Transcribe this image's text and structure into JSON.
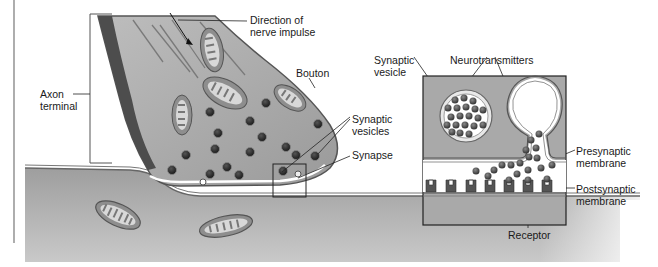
{
  "diagram": {
    "type": "biological-illustration",
    "labels": {
      "axon_terminal": [
        "Axon",
        "terminal"
      ],
      "direction": [
        "Direction of",
        "nerve impulse"
      ],
      "bouton": "Bouton",
      "synaptic_vesicles": [
        "Synaptic",
        "vesicles"
      ],
      "synapse": "Synapse",
      "synaptic_vesicle": [
        "Synaptic",
        "vesicle"
      ],
      "neurotransmitters": "Neurotransmitters",
      "presynaptic": [
        "Presynaptic",
        "membrane"
      ],
      "postsynaptic": [
        "Postsynaptic",
        "membrane"
      ],
      "receptor": "Receptor"
    },
    "colors": {
      "cell_fill": "#a8a8a8",
      "cell_dark_edge": "#555555",
      "postsynaptic_fill": "#b0b0b0",
      "vesicle": "#2e2e2e",
      "neurotransmitter": "#5a5a5a",
      "cleft": "#ffffff",
      "line": "#222222"
    },
    "inset": {
      "shown": true,
      "magnifies": "synapse"
    }
  }
}
